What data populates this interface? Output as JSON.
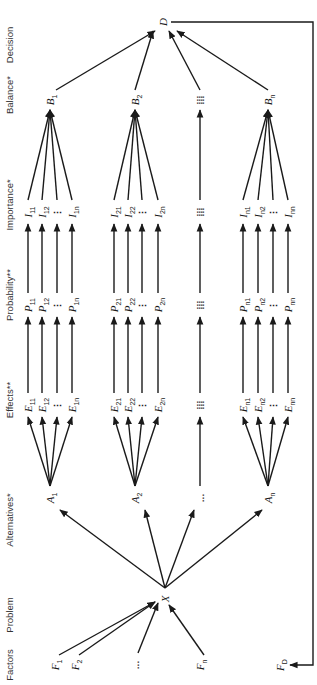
{
  "diagram": {
    "orientation": "rotated-90-ccw",
    "levels": [
      {
        "id": "factors",
        "label": "Factors"
      },
      {
        "id": "problem",
        "label": "Problem"
      },
      {
        "id": "alternatives",
        "label": "Alternatives*"
      },
      {
        "id": "effects",
        "label": "Effects**"
      },
      {
        "id": "probability",
        "label": "Probability**"
      },
      {
        "id": "importance",
        "label": "Importance*"
      },
      {
        "id": "balance",
        "label": "Balance*"
      },
      {
        "id": "decision",
        "label": "Decision"
      }
    ],
    "factors": [
      {
        "base": "F",
        "sub": "1"
      },
      {
        "base": "F",
        "sub": "2"
      },
      {
        "base": "…",
        "sub": ""
      },
      {
        "base": "F",
        "sub": "n"
      }
    ],
    "problem": {
      "base": "X",
      "sub": ""
    },
    "decision": {
      "base": "D",
      "sub": ""
    },
    "feedback": {
      "base": "F",
      "sub": "D"
    },
    "alternatives": [
      {
        "node": {
          "base": "A",
          "sub": "1"
        },
        "balance": {
          "base": "B",
          "sub": "1"
        },
        "effects": [
          {
            "base": "E",
            "sub": "11"
          },
          {
            "base": "E",
            "sub": "12"
          },
          {
            "base": "⋮",
            "sub": ""
          },
          {
            "base": "E",
            "sub": "1n"
          }
        ],
        "probabilities": [
          {
            "base": "P",
            "sub": "11"
          },
          {
            "base": "P",
            "sub": "12"
          },
          {
            "base": "⋮",
            "sub": ""
          },
          {
            "base": "P",
            "sub": "1n"
          }
        ],
        "importances": [
          {
            "base": "I",
            "sub": "11"
          },
          {
            "base": "I",
            "sub": "12"
          },
          {
            "base": "⋮",
            "sub": ""
          },
          {
            "base": "I",
            "sub": "1n"
          }
        ]
      },
      {
        "node": {
          "base": "A",
          "sub": "2"
        },
        "balance": {
          "base": "B",
          "sub": "2"
        },
        "effects": [
          {
            "base": "E",
            "sub": "21"
          },
          {
            "base": "E",
            "sub": "22"
          },
          {
            "base": "⋮",
            "sub": ""
          },
          {
            "base": "E",
            "sub": "2n"
          }
        ],
        "probabilities": [
          {
            "base": "P",
            "sub": "21"
          },
          {
            "base": "P",
            "sub": "22"
          },
          {
            "base": "⋮",
            "sub": ""
          },
          {
            "base": "P",
            "sub": "2n"
          }
        ],
        "importances": [
          {
            "base": "I",
            "sub": "21"
          },
          {
            "base": "I",
            "sub": "22"
          },
          {
            "base": "⋮",
            "sub": ""
          },
          {
            "base": "I",
            "sub": "2n"
          }
        ]
      },
      {
        "node": {
          "base": "…",
          "sub": ""
        },
        "balance": {
          "base": "⁞⁞⁞",
          "sub": ""
        },
        "effects": [
          {
            "base": "⁞⁞⁞",
            "sub": ""
          }
        ],
        "probabilities": [
          {
            "base": "⁞⁞⁞",
            "sub": ""
          }
        ],
        "importances": [
          {
            "base": "⁞⁞⁞",
            "sub": ""
          }
        ]
      },
      {
        "node": {
          "base": "A",
          "sub": "n"
        },
        "balance": {
          "base": "B",
          "sub": "n"
        },
        "effects": [
          {
            "base": "E",
            "sub": "n1"
          },
          {
            "base": "E",
            "sub": "n2"
          },
          {
            "base": "⋮",
            "sub": ""
          },
          {
            "base": "E",
            "sub": "nn"
          }
        ],
        "probabilities": [
          {
            "base": "P",
            "sub": "n1"
          },
          {
            "base": "P",
            "sub": "n2"
          },
          {
            "base": "⋮",
            "sub": ""
          },
          {
            "base": "P",
            "sub": "nn"
          }
        ],
        "importances": [
          {
            "base": "I",
            "sub": "n1"
          },
          {
            "base": "I",
            "sub": "n2"
          },
          {
            "base": "⋮",
            "sub": ""
          },
          {
            "base": "I",
            "sub": "nn"
          }
        ]
      }
    ]
  }
}
